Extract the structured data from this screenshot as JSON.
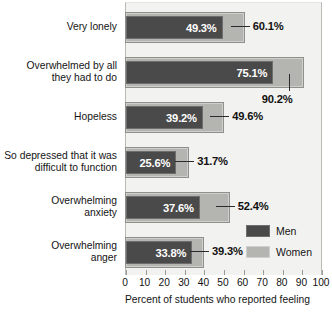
{
  "chart_data": {
    "type": "bar",
    "orientation": "horizontal",
    "title": "",
    "xlabel": "Percent of students who reported feeling",
    "ylabel": "",
    "xlim": [
      0,
      100
    ],
    "xticks": [
      "0",
      "10",
      "20",
      "30",
      "40",
      "50",
      "60",
      "70",
      "80",
      "90",
      "100"
    ],
    "grid": false,
    "legend_position": "inside-bottom-right",
    "categories": [
      "Very lonely",
      "Overwhelmed by all\nthey had to do",
      "Hopeless",
      "So depressed that it was\ndifficult to function",
      "Overwhelming\nanxiety",
      "Overwhelming\nanger"
    ],
    "series": [
      {
        "name": "Men",
        "color": "#4a4a4a",
        "values": [
          49.3,
          75.1,
          39.2,
          25.6,
          37.6,
          33.8
        ],
        "labels": [
          "49.3%",
          "75.1%",
          "39.2%",
          "25.6%",
          "37.6%",
          "33.8%"
        ]
      },
      {
        "name": "Women",
        "color": "#b4b4b1",
        "values": [
          60.1,
          90.2,
          49.6,
          31.7,
          52.4,
          39.3
        ],
        "labels": [
          "60.1%",
          "90.2%",
          "49.6%",
          "31.7%",
          "52.4%",
          "39.3%"
        ]
      }
    ]
  },
  "legend": {
    "items": [
      {
        "label": "Men",
        "color": "#4a4a4a"
      },
      {
        "label": "Women",
        "color": "#b4b4b1"
      }
    ]
  },
  "axis": {
    "xlabel": "Percent of students who reported feeling"
  },
  "footnote": ""
}
